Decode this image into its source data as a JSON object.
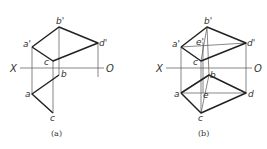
{
  "figures": [
    {
      "id": "a",
      "caption": "(a)",
      "axis": {
        "left_label": "X",
        "right_label": "O"
      },
      "labels": {
        "b_prime": "b'",
        "a_prime": "a'",
        "d_prime": "d'",
        "c_prime": "c",
        "b": "b",
        "a": "a",
        "c": "c"
      }
    },
    {
      "id": "b",
      "caption": "(b)",
      "axis": {
        "left_label": "X",
        "right_label": "O"
      },
      "labels": {
        "b_prime": "b'",
        "a_prime": "a'",
        "d_prime": "d'",
        "c_prime": "c",
        "e_prime": "e'",
        "b": "b",
        "a": "a",
        "d": "d",
        "c": "c",
        "e": "e"
      }
    }
  ]
}
